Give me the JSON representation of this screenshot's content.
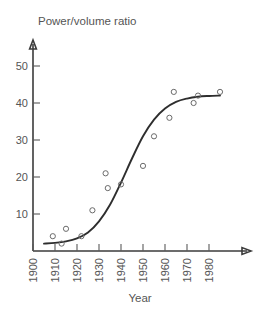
{
  "chart_data": {
    "type": "scatter",
    "title": "Power/volume ratio",
    "xlabel": "Year",
    "ylabel": "",
    "xlim": [
      1900,
      1990
    ],
    "ylim": [
      0,
      55
    ],
    "grid": false,
    "legend": null,
    "xticks": [
      1900,
      1910,
      1920,
      1930,
      1940,
      1950,
      1960,
      1970,
      1980
    ],
    "xticklabels": [
      "1900",
      "1910",
      "1920",
      "1930",
      "1940",
      "1950",
      "1960",
      "1970",
      "1980"
    ],
    "yticks": [
      10,
      20,
      30,
      40,
      50
    ],
    "yticklabels": [
      "10",
      "20",
      "30",
      "40",
      "50"
    ],
    "marker": "open-circle",
    "points": [
      {
        "x": 1909,
        "y": 4.0
      },
      {
        "x": 1913,
        "y": 2.0
      },
      {
        "x": 1915,
        "y": 6.0
      },
      {
        "x": 1922,
        "y": 4.0
      },
      {
        "x": 1927,
        "y": 11.0
      },
      {
        "x": 1933,
        "y": 21.0
      },
      {
        "x": 1934,
        "y": 17.0
      },
      {
        "x": 1940,
        "y": 18.0
      },
      {
        "x": 1950,
        "y": 23.0
      },
      {
        "x": 1955,
        "y": 31.0
      },
      {
        "x": 1962,
        "y": 36.0
      },
      {
        "x": 1964,
        "y": 43.0
      },
      {
        "x": 1973,
        "y": 40.0
      },
      {
        "x": 1975,
        "y": 42.0
      },
      {
        "x": 1985,
        "y": 43.0
      }
    ],
    "fit_curve": {
      "name": "logistic fit",
      "x": [
        1905,
        1910,
        1915,
        1920,
        1925,
        1930,
        1935,
        1940,
        1945,
        1950,
        1955,
        1960,
        1965,
        1970,
        1975,
        1980,
        1985
      ],
      "y": [
        2.0,
        2.2,
        2.6,
        3.4,
        5.0,
        8.0,
        12.5,
        18.5,
        25.0,
        31.0,
        35.5,
        38.5,
        40.3,
        41.2,
        41.7,
        41.9,
        42.0
      ]
    },
    "colors": {
      "axis": "#3b3b3b",
      "curve": "#2e2e2e",
      "marker": "#6b6b6b",
      "text": "#555555",
      "background": "#ffffff"
    }
  }
}
